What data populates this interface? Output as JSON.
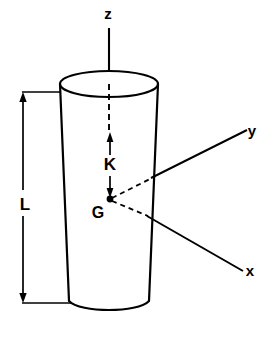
{
  "figure": {
    "type": "engineering-diagram",
    "background_color": "#ffffff",
    "line_color": "#000000"
  },
  "axes": [
    {
      "id": "z",
      "label": "z",
      "direction": "up",
      "style": "solid-then-dashed",
      "label_x": 108,
      "label_y": 19
    },
    {
      "id": "y",
      "label": "y",
      "direction": "upper-right",
      "style": "dashed-then-solid",
      "label_x": 252,
      "label_y": 136
    },
    {
      "id": "x",
      "label": "x",
      "direction": "lower-right",
      "style": "dashed-then-solid",
      "label_x": 250,
      "label_y": 276
    }
  ],
  "dimensions": [
    {
      "id": "L",
      "label": "L",
      "orientation": "vertical",
      "arrowheads": "both",
      "label_x": 25,
      "label_y": 210,
      "description": "Overall length of the body"
    },
    {
      "id": "K",
      "label": "K",
      "orientation": "vertical",
      "arrowheads": "both",
      "label_x": 110,
      "label_y": 170,
      "description": "Distance from top face to centre of gravity"
    }
  ],
  "points": [
    {
      "id": "G",
      "label": "G",
      "label_x": 98,
      "label_y": 218,
      "marker_x": 110,
      "marker_y": 199,
      "description": "Centre of gravity, origin of the x-y-z axes"
    }
  ]
}
